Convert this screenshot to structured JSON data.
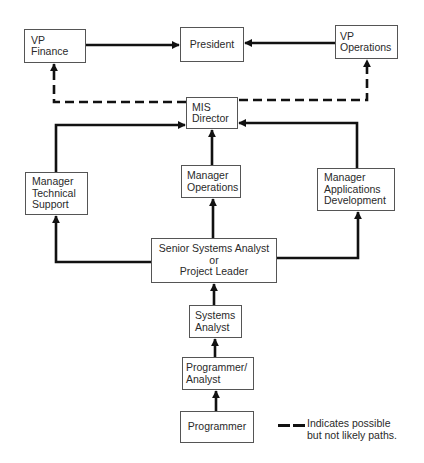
{
  "diagram": {
    "type": "career-path-org-chart",
    "boxes": {
      "vp_finance": {
        "lines": [
          "VP",
          "Finance"
        ]
      },
      "president": {
        "lines": [
          "President"
        ]
      },
      "vp_operations": {
        "lines": [
          "VP",
          "Operations"
        ]
      },
      "mis_director": {
        "lines": [
          "MIS",
          "Director"
        ]
      },
      "manager_technical_support": {
        "lines": [
          "Manager",
          "Technical",
          "Support"
        ]
      },
      "manager_operations": {
        "lines": [
          "Manager",
          "Operations"
        ]
      },
      "manager_applications_development": {
        "lines": [
          "Manager",
          "Applications",
          "Development"
        ]
      },
      "senior_systems_analyst": {
        "lines": [
          "Senior Systems Analyst",
          "or",
          "Project Leader"
        ]
      },
      "systems_analyst": {
        "lines": [
          "Systems",
          "Analyst"
        ]
      },
      "programmer_analyst": {
        "lines": [
          "Programmer/",
          "Analyst"
        ]
      },
      "programmer": {
        "lines": [
          "Programmer"
        ]
      }
    },
    "edges": [
      {
        "from": "Programmer",
        "to": "Programmer/Analyst",
        "style": "solid"
      },
      {
        "from": "Programmer/Analyst",
        "to": "Systems Analyst",
        "style": "solid"
      },
      {
        "from": "Systems Analyst",
        "to": "Senior Systems Analyst or Project Leader",
        "style": "solid"
      },
      {
        "from": "Senior Systems Analyst or Project Leader",
        "to": "Manager Technical Support",
        "style": "solid"
      },
      {
        "from": "Senior Systems Analyst or Project Leader",
        "to": "Manager Operations",
        "style": "solid"
      },
      {
        "from": "Senior Systems Analyst or Project Leader",
        "to": "Manager Applications Development",
        "style": "solid"
      },
      {
        "from": "Manager Technical Support",
        "to": "MIS Director",
        "style": "solid"
      },
      {
        "from": "Manager Operations",
        "to": "MIS Director",
        "style": "solid"
      },
      {
        "from": "Manager Applications Development",
        "to": "MIS Director",
        "style": "solid"
      },
      {
        "from": "MIS Director",
        "to": "VP Finance",
        "style": "dashed"
      },
      {
        "from": "MIS Director",
        "to": "VP Operations",
        "style": "dashed"
      },
      {
        "from": "VP Finance",
        "to": "President",
        "style": "solid"
      },
      {
        "from": "VP Operations",
        "to": "President",
        "style": "solid"
      }
    ],
    "legend": {
      "lines": [
        "Indicates possible",
        "but not likely paths."
      ],
      "symbol": "dashed-line"
    },
    "colors": {
      "line": "#111111",
      "box_border": "#555555",
      "text": "#2a2a2a",
      "background": "#ffffff"
    }
  }
}
